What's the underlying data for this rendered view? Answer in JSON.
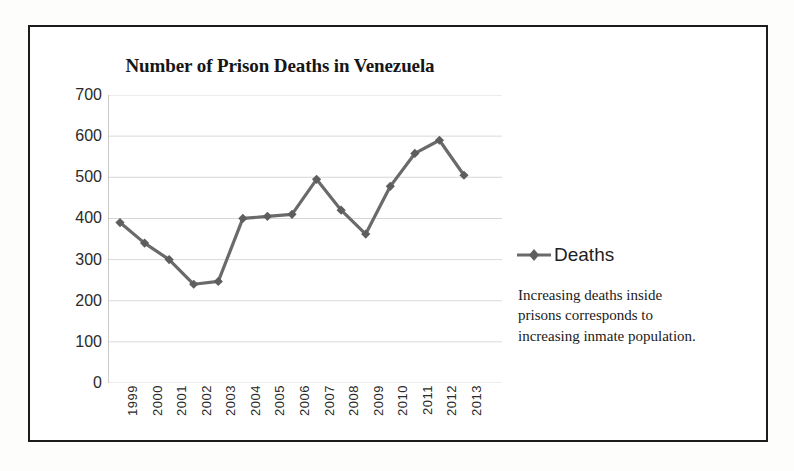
{
  "chart_data": {
    "type": "line",
    "title": "Number of Prison Deaths in Venezuela",
    "xlabel": "",
    "ylabel": "",
    "categories": [
      "1999",
      "2000",
      "2001",
      "2002",
      "2003",
      "2004",
      "2005",
      "2006",
      "2007",
      "2008",
      "2009",
      "2010",
      "2011",
      "2012",
      "2013"
    ],
    "series": [
      {
        "name": "Deaths",
        "values": [
          390,
          340,
          300,
          240,
          247,
          400,
          405,
          410,
          495,
          420,
          362,
          478,
          558,
          590,
          505
        ]
      }
    ],
    "ylim": [
      0,
      700
    ],
    "y_ticks": [
      0,
      100,
      200,
      300,
      400,
      500,
      600,
      700
    ],
    "y_tick_labels": [
      "0",
      "100",
      "200",
      "300",
      "400",
      "500",
      "600",
      "700"
    ],
    "grid": true,
    "grid_axis": "y",
    "legend": {
      "position": "right",
      "entries": [
        "Deaths"
      ],
      "marker": "diamond"
    },
    "annotations": [
      "Increasing deaths inside",
      "prisons  corresponds to",
      "increasing inmate population."
    ],
    "colors": {
      "series_line": "#6a6a6a",
      "marker": "#5e5e5e",
      "gridline": "#d6d6d6",
      "axis": "#9a9a9a",
      "text": "#2a2a2a",
      "title": "#161616",
      "frame": "#1c1c1c"
    }
  },
  "legend": {
    "deaths_label": "Deaths"
  },
  "annotation": {
    "line1": "Increasing deaths inside",
    "line2": "prisons  corresponds to",
    "line3": "increasing inmate population."
  },
  "title": {
    "text": "Number of Prison Deaths in Venezuela"
  }
}
